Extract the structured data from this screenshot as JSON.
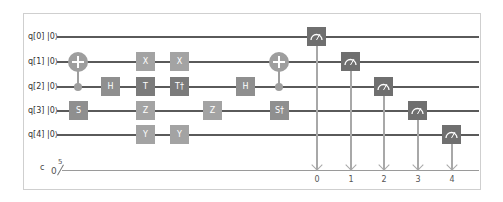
{
  "circuit": {
    "qubits": [
      {
        "label": "q[0]",
        "init": "|0⟩"
      },
      {
        "label": "q[1]",
        "init": "|0⟩"
      },
      {
        "label": "q[2]",
        "init": "|0⟩"
      },
      {
        "label": "q[3]",
        "init": "|0⟩"
      },
      {
        "label": "q[4]",
        "init": "|0⟩"
      }
    ],
    "classical_register": {
      "label": "c",
      "value": "0",
      "width": "5"
    },
    "gates": [
      {
        "type": "cnot",
        "control": 2,
        "target": 1,
        "column": 1
      },
      {
        "type": "S",
        "label": "S",
        "qubit": 3,
        "column": 1
      },
      {
        "type": "H",
        "label": "H",
        "qubit": 2,
        "column": 2
      },
      {
        "type": "X",
        "label": "X",
        "qubit": 1,
        "column": 3
      },
      {
        "type": "T",
        "label": "T",
        "qubit": 2,
        "column": 3
      },
      {
        "type": "Z",
        "label": "Z",
        "qubit": 3,
        "column": 3
      },
      {
        "type": "Y",
        "label": "Y",
        "qubit": 4,
        "column": 3
      },
      {
        "type": "X",
        "label": "X",
        "qubit": 1,
        "column": 4
      },
      {
        "type": "Tdg",
        "label": "T†",
        "qubit": 2,
        "column": 4
      },
      {
        "type": "Y",
        "label": "Y",
        "qubit": 4,
        "column": 4
      },
      {
        "type": "Z",
        "label": "Z",
        "qubit": 3,
        "column": 5
      },
      {
        "type": "H",
        "label": "H",
        "qubit": 2,
        "column": 6
      },
      {
        "type": "cnot",
        "control": 2,
        "target": 1,
        "column": 7
      },
      {
        "type": "Sdg",
        "label": "S†",
        "qubit": 3,
        "column": 7
      }
    ],
    "measurements": [
      {
        "qubit": 0,
        "cbit": "0"
      },
      {
        "qubit": 1,
        "cbit": "1"
      },
      {
        "qubit": 2,
        "cbit": "2"
      },
      {
        "qubit": 3,
        "cbit": "3"
      },
      {
        "qubit": 4,
        "cbit": "4"
      }
    ],
    "icons": {
      "measure": "meter-icon",
      "cnot_target": "plus-circle-icon",
      "control": "dot-icon"
    },
    "colors": {
      "wire": "#5a5a5a",
      "gate_light": "#a3a3a3",
      "gate_dark": "#7b7b7b",
      "measure": "#6f6f6f",
      "classical_wire": "#9a9a9a",
      "frame": "#cfcfcf"
    }
  }
}
